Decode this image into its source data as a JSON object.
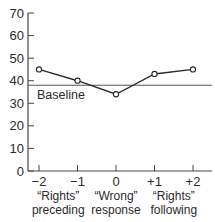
{
  "chart_data": {
    "type": "line",
    "title": "",
    "xlabel": "",
    "ylabel": "",
    "ylim": [
      0,
      70
    ],
    "yticks": [
      0,
      10,
      20,
      30,
      40,
      50,
      60,
      70
    ],
    "ytick_labels": [
      "0",
      "10",
      "20",
      "30",
      "40",
      "50",
      "60",
      "70"
    ],
    "x": [
      -2,
      -1,
      0,
      1,
      2
    ],
    "xtick_labels": [
      "−2",
      "−1",
      "0",
      "+1",
      "+2"
    ],
    "series": [
      {
        "name": "Response",
        "values": [
          45,
          40,
          34,
          43,
          45
        ],
        "marker": "open-circle",
        "color": "#2a2a2a"
      }
    ],
    "reference_lines": [
      {
        "name": "Baseline",
        "y": 38,
        "label": "Baseline"
      }
    ],
    "category_annotations": [
      {
        "x_center": -1.5,
        "line1": "“Rights”",
        "line2": "preceding"
      },
      {
        "x_center": 0,
        "line1": "“Wrong”",
        "line2": "response"
      },
      {
        "x_center": 1.5,
        "line1": "“Rights”",
        "line2": "following"
      }
    ],
    "grid": false,
    "legend": "none"
  }
}
